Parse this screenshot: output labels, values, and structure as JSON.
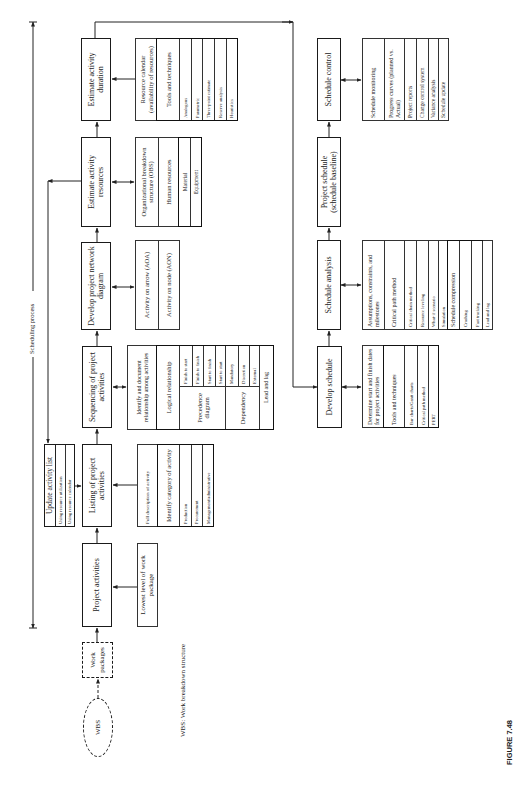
{
  "colors": {
    "line": "#222222",
    "background": "#ffffff"
  },
  "diagram": {
    "wbs_label": "WBS",
    "work_packages_label": "Work packages",
    "scheduling_process_label": "Scheduling process",
    "footnote": "WBS: Work breakdown structure",
    "figure_label": "FIGURE 7.48",
    "update_activity_list": {
      "title": "Update activity list",
      "items": [
        "Using resource utilization",
        "Using resource calendar"
      ]
    },
    "main_flow": [
      {
        "label": "Project activities"
      },
      {
        "label": "Listing of project activities"
      },
      {
        "label": "Sequencing of project activities"
      },
      {
        "label": "Develop project network diagram"
      },
      {
        "label": "Estimate activity resources"
      },
      {
        "label": "Estimate activity duration"
      }
    ],
    "schedule_flow": [
      {
        "label": "Develop schedule"
      },
      {
        "label": "Schedule analysis"
      },
      {
        "label": "Project schedule (schedule baseline)"
      },
      {
        "label": "Schedule control"
      }
    ],
    "details": {
      "project_activities": [
        "Lowest level of work package"
      ],
      "listing": {
        "description": "Full description of activity",
        "category_title": "Identify category of activity",
        "categories": [
          "Production",
          "Procurement",
          "Management/administrative"
        ]
      },
      "sequencing": {
        "description": "Identify and document relationship among activities",
        "logical": "Logical relationship",
        "precedence_label": "Precedence diagram",
        "precedence": [
          "Finish to start",
          "Finish to finish",
          "Start to finish",
          "Start to start"
        ],
        "dependency_label": "Dependency",
        "dependency": [
          "Mandatory",
          "Discretion",
          "External"
        ],
        "lead_lag": "Lead and lag"
      },
      "network": [
        "Activity on arrow (AOA)",
        "Activity on node (AON)"
      ],
      "resources": {
        "obs": "Organizational breakdown structure (OBS)",
        "human": "Human resources",
        "items": [
          "Material",
          "Equipment"
        ]
      },
      "duration": {
        "calendar": "Resource calendar (availability of resources)",
        "tools": "Tools and techniques",
        "items": [
          "Analogous",
          "Parametric",
          "Three-point estimate",
          "Reserve analysis",
          "Heuristics"
        ]
      },
      "develop_schedule": {
        "description": "Determine start and finish dates for project activities",
        "tools": "Tools and techniques",
        "items": [
          "Bar charts/Gantt charts",
          "Critical path method",
          "PERT"
        ]
      },
      "schedule_analysis": {
        "items": [
          "Assumptions, constraints, and milestones",
          "Critical path method",
          "Critical chain method",
          "Resource leveling",
          "What-if scenario",
          "Simulation"
        ],
        "compression_label": "Schedule compression",
        "compression": [
          "Crashing",
          "Fast tracking"
        ],
        "lead_lag": "Lead and lag"
      },
      "schedule_control": [
        "Schedule monitoring",
        "Progress curves (planned vs. Actual)",
        "Project reports",
        "Change control system",
        "Variance analysis",
        "Schedule update"
      ]
    }
  }
}
